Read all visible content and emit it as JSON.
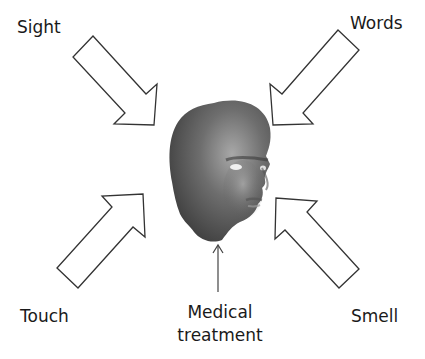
{
  "diagram": {
    "center": {
      "name": "Human head",
      "description": "3D-rendered grey head facing right"
    },
    "labels": {
      "sight": "Sight",
      "words": "Words",
      "touch": "Touch",
      "smell": "Smell",
      "medical_line1": "Medical",
      "medical_line2": "treatment"
    },
    "arrows": [
      {
        "from": "Sight",
        "to": "head",
        "style": "hollow block arrow"
      },
      {
        "from": "Words",
        "to": "head",
        "style": "hollow block arrow"
      },
      {
        "from": "Touch",
        "to": "head",
        "style": "hollow block arrow"
      },
      {
        "from": "Smell",
        "to": "head",
        "style": "hollow block arrow"
      },
      {
        "from": "Medical treatment",
        "to": "head",
        "style": "thin line arrow"
      }
    ],
    "colors": {
      "arrow_stroke": "#333333",
      "arrow_fill": "#ffffff",
      "head_dark": "#4a4a4a",
      "head_light": "#9a9a9a",
      "text": "#1a1a1a"
    }
  }
}
